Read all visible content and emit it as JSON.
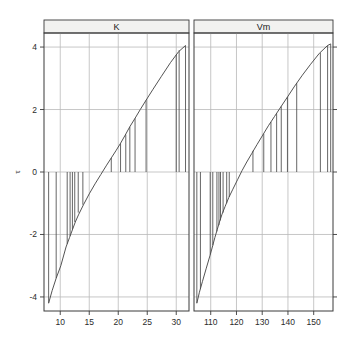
{
  "figure": {
    "background": "#ffffff",
    "frame_color": "#3a3a3a",
    "grid_color": "#b9b9b9",
    "data_color": "#4a4a4a",
    "strip_fill": "#f2f2f0",
    "strip_border": "#3a3a3a"
  },
  "axis": {
    "y_title": "τ",
    "y_ticks": [
      "4",
      "2",
      "0",
      "-2",
      "-4"
    ],
    "y_values": [
      4,
      2,
      0,
      -2,
      -4
    ]
  },
  "chart_data": {
    "type": "line",
    "title": "",
    "subtitle": "",
    "xlabel": "",
    "ylabel": "τ",
    "grid": true,
    "legend_position": "none",
    "layout": "two panels side by side, shared y axis, strip labels on top",
    "ylim": [
      -4.45,
      4.45
    ],
    "panels": [
      {
        "label": "K",
        "xlabel": "",
        "xlim": [
          7.2,
          32.2
        ],
        "xticks": [
          10,
          15,
          20,
          25,
          30
        ],
        "xtick_labels": [
          "10",
          "15",
          "20",
          "25",
          "30"
        ],
        "series": [
          {
            "name": "quantile-curve",
            "type": "line",
            "x": [
              8.0,
              8.6,
              9.3,
              10.1,
              11.0,
              11.6,
              12.1,
              12.6,
              13.2,
              14.0,
              15.0,
              16.0,
              17.0,
              18.0,
              18.8,
              19.6,
              20.4,
              21.2,
              22.0,
              22.9,
              23.8,
              24.8,
              26.0,
              27.4,
              29.0,
              30.4,
              31.6
            ],
            "y": [
              -4.2,
              -3.8,
              -3.4,
              -3.0,
              -2.4,
              -2.1,
              -1.85,
              -1.6,
              -1.35,
              -1.05,
              -0.7,
              -0.38,
              -0.08,
              0.22,
              0.45,
              0.68,
              0.92,
              1.18,
              1.45,
              1.72,
              2.0,
              2.3,
              2.65,
              3.05,
              3.5,
              3.85,
              4.05
            ]
          },
          {
            "name": "drop-lines",
            "type": "vertical-segments-to-zero",
            "x": [
              8.0,
              9.3,
              11.2,
              11.7,
              12.1,
              12.5,
              13.1,
              13.9,
              18.8,
              20.4,
              21.3,
              22.0,
              22.9,
              24.8,
              30.0,
              30.5,
              31.6
            ],
            "y": [
              -4.2,
              -3.4,
              -2.3,
              -2.05,
              -1.85,
              -1.6,
              -1.3,
              -1.05,
              0.45,
              0.92,
              1.2,
              1.45,
              1.72,
              2.3,
              3.75,
              3.9,
              4.05
            ]
          }
        ]
      },
      {
        "label": "Vm",
        "xlabel": "",
        "xlim": [
          103.5,
          157.5
        ],
        "xticks": [
          110,
          120,
          130,
          140,
          150
        ],
        "xtick_labels": [
          "110",
          "120",
          "130",
          "140",
          "150"
        ],
        "series": [
          {
            "name": "quantile-curve",
            "type": "line",
            "x": [
              104.6,
              105.6,
              106.8,
              108.2,
              109.8,
              110.8,
              111.6,
              112.5,
              113.4,
              114.4,
              115.6,
              117.0,
              118.6,
              120.4,
              122.2,
              124.0,
              126.0,
              128.0,
              130.2,
              132.4,
              134.8,
              137.2,
              139.8,
              142.6,
              145.6,
              148.8,
              152.2,
              155.4,
              156.6
            ],
            "y": [
              -4.2,
              -3.85,
              -3.5,
              -3.1,
              -2.65,
              -2.35,
              -2.1,
              -1.85,
              -1.6,
              -1.35,
              -1.1,
              -0.82,
              -0.55,
              -0.25,
              0.05,
              0.32,
              0.6,
              0.88,
              1.18,
              1.48,
              1.78,
              2.08,
              2.4,
              2.75,
              3.1,
              3.45,
              3.8,
              4.05,
              4.1
            ]
          },
          {
            "name": "drop-lines",
            "type": "vertical-segments-to-zero",
            "x": [
              104.6,
              106.0,
              109.8,
              110.8,
              112.4,
              113.2,
              113.8,
              114.8,
              116.2,
              117.2,
              126.4,
              130.6,
              133.4,
              135.6,
              137.4,
              139.8,
              143.4,
              152.6,
              155.4,
              156.6
            ],
            "y": [
              -4.2,
              -3.75,
              -2.65,
              -2.35,
              -1.9,
              -1.7,
              -1.55,
              -1.3,
              -1.0,
              -0.8,
              0.68,
              1.22,
              1.6,
              1.88,
              2.1,
              2.4,
              2.85,
              3.82,
              4.05,
              4.1
            ]
          }
        ]
      }
    ]
  }
}
